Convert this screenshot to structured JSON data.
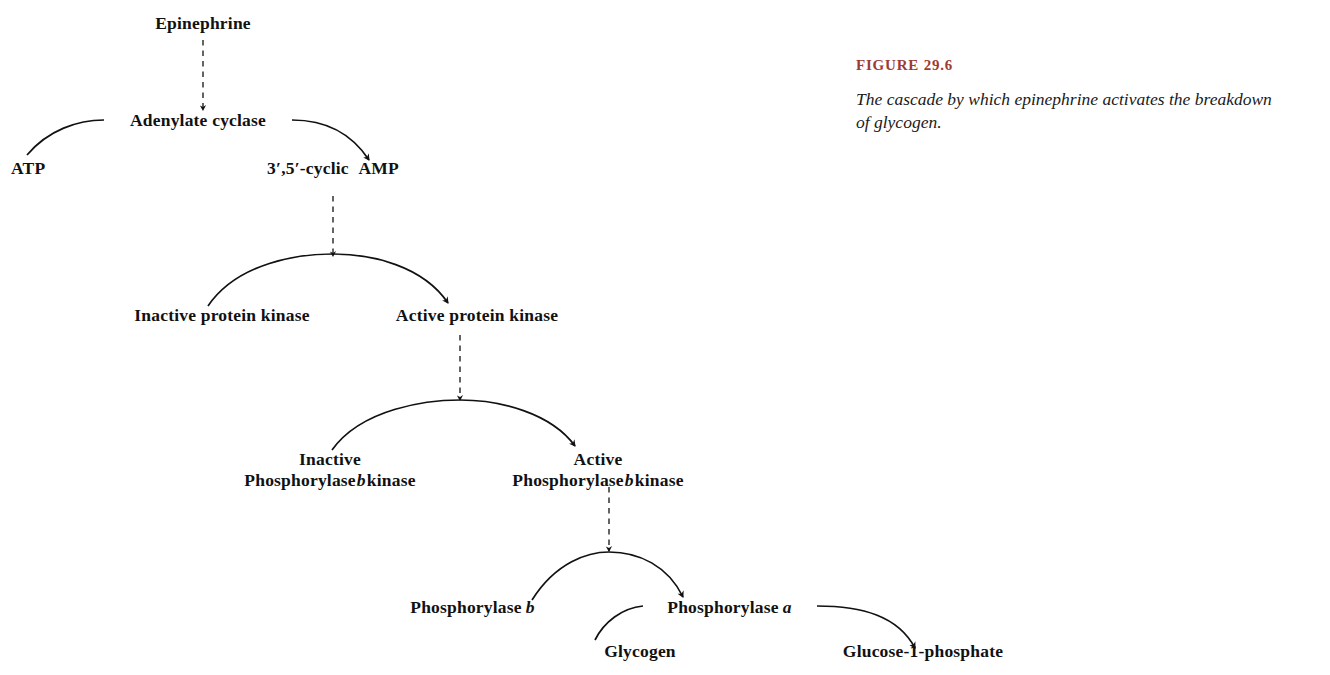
{
  "figure": {
    "number_label": "FIGURE 29.6",
    "caption": "The cascade by which epinephrine activates the breakdown of glycogen.",
    "accent_color": "#9d3b33",
    "ink_color": "#111111",
    "background_color": "#ffffff"
  },
  "diagram": {
    "nodes": {
      "epinephrine": "Epinephrine",
      "adenylate_cyclase": "Adenylate cyclase",
      "atp": "ATP",
      "cyclic_amp_prefix": "3′,5′-cyclic",
      "cyclic_amp_suffix": "AMP",
      "inactive_protein_kinase": "Inactive protein kinase",
      "active_protein_kinase": "Active protein kinase",
      "inactive_phos_b_kinase_line1": "Inactive",
      "inactive_phos_b_kinase_line2_a": "Phosphorylase",
      "inactive_phos_b_kinase_italic": "b",
      "inactive_phos_b_kinase_line2_b": "kinase",
      "active_phos_b_kinase_line1": "Active",
      "active_phos_b_kinase_line2_a": "Phosphorylase",
      "active_phos_b_kinase_italic": "b",
      "active_phos_b_kinase_line2_b": "kinase",
      "phosphorylase_b_text": "Phosphorylase",
      "phosphorylase_b_italic": "b",
      "phosphorylase_a_text": "Phosphorylase",
      "phosphorylase_a_italic": "a",
      "glycogen": "Glycogen",
      "glucose_1_phosphate": "Glucose-1-phosphate"
    },
    "edges": [
      {
        "name": "epinephrine-to-adenylate-cyclase",
        "style": "dashed",
        "from": "Epinephrine",
        "to": "Adenylate cyclase"
      },
      {
        "name": "atp-to-cyclic-amp",
        "style": "solid-arc",
        "from": "ATP",
        "to": "3′,5′-cyclic AMP",
        "enzyme": "Adenylate cyclase"
      },
      {
        "name": "cyclic-amp-to-protein-kinase",
        "style": "dashed",
        "from": "3′,5′-cyclic AMP",
        "to": "Active protein kinase"
      },
      {
        "name": "inactive-to-active-protein-kinase",
        "style": "solid-arc",
        "from": "Inactive protein kinase",
        "to": "Active protein kinase"
      },
      {
        "name": "protein-kinase-to-phos-b-kinase",
        "style": "dashed",
        "from": "Active protein kinase",
        "to": "Active Phosphorylase b kinase"
      },
      {
        "name": "inactive-to-active-phos-b-kinase",
        "style": "solid-arc",
        "from": "Inactive Phosphorylase b kinase",
        "to": "Active Phosphorylase b kinase"
      },
      {
        "name": "phos-b-kinase-to-phosphorylase",
        "style": "dashed",
        "from": "Active Phosphorylase b kinase",
        "to": "Phosphorylase a"
      },
      {
        "name": "phosphorylase-b-to-a",
        "style": "solid-arc",
        "from": "Phosphorylase b",
        "to": "Phosphorylase a"
      },
      {
        "name": "glycogen-to-glucose-1-phosphate",
        "style": "solid-arc",
        "from": "Glycogen",
        "to": "Glucose-1-phosphate",
        "enzyme": "Phosphorylase a"
      }
    ]
  }
}
